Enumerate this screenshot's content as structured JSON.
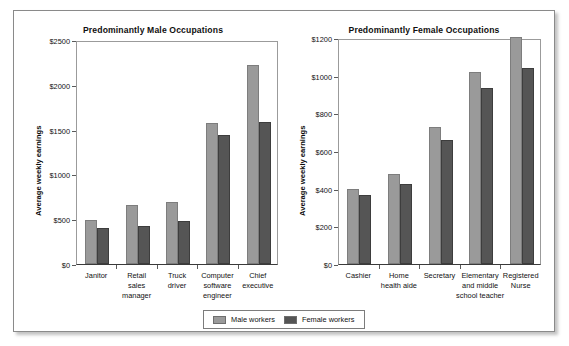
{
  "figure": {
    "legend": {
      "entries": [
        {
          "label": "Male workers",
          "color": "#9a9a9a",
          "swatch": "male-swatch"
        },
        {
          "label": "Female workers",
          "color": "#555555",
          "swatch": "female-swatch"
        }
      ]
    }
  },
  "chart_data": [
    {
      "type": "bar",
      "title": "Predominantly Male Occupations",
      "xlabel": "",
      "ylabel": "Average weekly earnings",
      "ylim": [
        0,
        2500
      ],
      "yticks": [
        0,
        500,
        1000,
        1500,
        2000,
        2500
      ],
      "ytick_labels": [
        "$0",
        "$500",
        "$1000",
        "$1500",
        "$2000",
        "$2500"
      ],
      "grid": false,
      "legend_position": "bottom-center",
      "categories": [
        "Janitor",
        "Retail\nsales\nmanager",
        "Truck\ndriver",
        "Computer\nsoftware\nengineer",
        "Chief\nexecutive"
      ],
      "series": [
        {
          "name": "Male workers",
          "color": "#9a9a9a",
          "values": [
            490,
            655,
            690,
            1575,
            2225
          ]
        },
        {
          "name": "Female workers",
          "color": "#555555",
          "values": [
            400,
            425,
            485,
            1435,
            1585
          ]
        }
      ]
    },
    {
      "type": "bar",
      "title": "Predominantly Female Occupations",
      "xlabel": "",
      "ylabel": "Average weekly earnings",
      "ylim": [
        0,
        1200
      ],
      "yticks": [
        0,
        200,
        400,
        600,
        800,
        1000,
        1200
      ],
      "ytick_labels": [
        "$0",
        "$200",
        "$400",
        "$600",
        "$800",
        "$1000",
        "$1200"
      ],
      "grid": false,
      "legend_position": "bottom-center",
      "categories": [
        "Cashier",
        "Home\nhealth aide",
        "Secretary",
        "Elementary\nand middle\nschool teacher",
        "Registered\nNurse"
      ],
      "series": [
        {
          "name": "Male workers",
          "color": "#9a9a9a",
          "values": [
            400,
            480,
            725,
            1020,
            1205
          ]
        },
        {
          "name": "Female workers",
          "color": "#555555",
          "values": [
            368,
            425,
            660,
            935,
            1040
          ]
        }
      ]
    }
  ]
}
